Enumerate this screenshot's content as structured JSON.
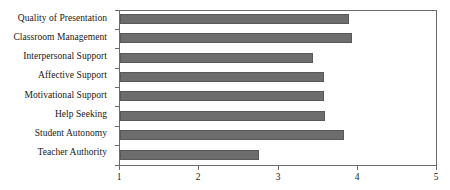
{
  "chart_data": {
    "type": "bar",
    "orientation": "horizontal",
    "title": "",
    "xlabel": "",
    "ylabel": "",
    "xlim": [
      1,
      5
    ],
    "xticks": [
      1,
      2,
      3,
      4,
      5
    ],
    "xtick_labels": [
      "1",
      "2",
      "3",
      "4",
      "5"
    ],
    "grid": false,
    "legend": false,
    "bar_color": "#6d6d6d",
    "bar_edge_color": "#585858",
    "frame_color": "#6b6b6b",
    "categories": [
      "Quality of Presentation",
      "Classroom Management",
      "Interpersonal Support",
      "Affective Support",
      "Motivational Support",
      "Help Seeking",
      "Student Autonomy",
      "Teacher Authority"
    ],
    "values": [
      3.88,
      3.92,
      3.43,
      3.57,
      3.57,
      3.58,
      3.82,
      2.75
    ]
  }
}
